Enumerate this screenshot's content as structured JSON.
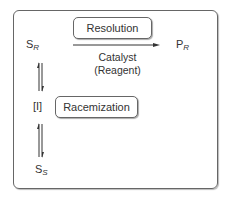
{
  "diagram": {
    "species": {
      "sr": {
        "base": "S",
        "sub": "R"
      },
      "pr": {
        "base": "P",
        "sub": "R"
      },
      "intermediate": "[I]",
      "ss": {
        "base": "S",
        "sub": "S"
      }
    },
    "boxes": {
      "resolution": "Resolution",
      "racemization": "Racemization"
    },
    "arrow_labels": {
      "catalyst": "Catalyst",
      "reagent": "(Reagent)"
    }
  }
}
